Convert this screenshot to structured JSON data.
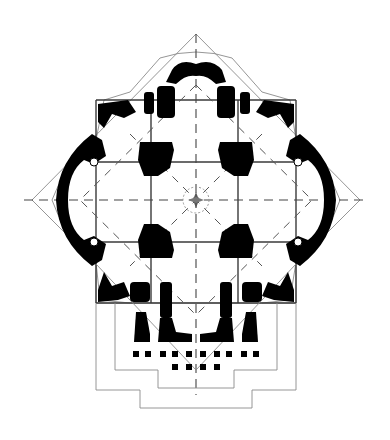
{
  "figure": {
    "title": "Architectural floor plan",
    "colors": {
      "background": "#ffffff",
      "mass": "#000000",
      "line": "#8a8a8a",
      "grid": "#3a3a3a"
    },
    "outer_diamond": {
      "top": [
        196,
        34
      ],
      "left": [
        32,
        200
      ],
      "right": [
        360,
        200
      ]
    },
    "grid_x": [
      96,
      151,
      238,
      296
    ],
    "grid_y": [
      100,
      162,
      242,
      303
    ],
    "center": [
      196,
      200
    ],
    "center_symbol": "compass-star-icon",
    "front_columns_row1": 10,
    "front_columns_row2": 4
  }
}
